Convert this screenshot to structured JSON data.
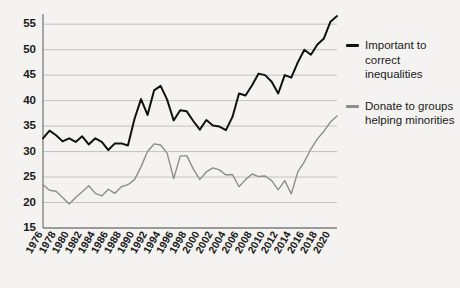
{
  "chart_data": {
    "type": "line",
    "title": "",
    "xlabel": "",
    "ylabel": "",
    "ylim": [
      15,
      57
    ],
    "yticks": [
      15,
      20,
      25,
      30,
      35,
      40,
      45,
      50,
      55
    ],
    "grid": true,
    "legend_position": "right",
    "xlim": [
      1976,
      2021
    ],
    "xtick_labels": [
      "1976",
      "1978",
      "1980",
      "1982",
      "1984",
      "1986",
      "1988",
      "1990",
      "1992",
      "1994",
      "1996",
      "1998",
      "2000",
      "2002",
      "2004",
      "2006",
      "2008",
      "2010",
      "2012",
      "2014",
      "2016",
      "2018",
      "2020"
    ],
    "x": [
      1976,
      1977,
      1978,
      1979,
      1980,
      1981,
      1982,
      1983,
      1984,
      1985,
      1986,
      1987,
      1988,
      1989,
      1990,
      1991,
      1992,
      1993,
      1994,
      1995,
      1996,
      1997,
      1998,
      1999,
      2000,
      2001,
      2002,
      2003,
      2004,
      2005,
      2006,
      2007,
      2008,
      2009,
      2010,
      2011,
      2012,
      2013,
      2014,
      2015,
      2016,
      2017,
      2018,
      2019,
      2020,
      2021
    ],
    "series": [
      {
        "name": "Important to correct inequalities",
        "color": "#111111",
        "values": [
          32.6,
          34.1,
          33.2,
          32.0,
          32.6,
          31.9,
          33.0,
          31.4,
          32.6,
          31.9,
          30.3,
          31.6,
          31.6,
          31.2,
          36.4,
          40.3,
          37.2,
          42.0,
          42.9,
          40.2,
          36.1,
          38.1,
          37.9,
          36.0,
          34.3,
          36.2,
          35.1,
          34.9,
          34.2,
          36.8,
          41.4,
          41.0,
          43.0,
          45.3,
          45.0,
          43.7,
          41.4,
          45.0,
          44.5,
          47.5,
          50.0,
          49.0,
          51.0,
          52.2,
          55.5,
          56.6
        ]
      },
      {
        "name": "Donate to groups helping minorities",
        "color": "#8d8d8a",
        "values": [
          23.5,
          22.4,
          22.2,
          21.0,
          19.7,
          21.0,
          22.1,
          23.3,
          21.8,
          21.3,
          22.6,
          21.8,
          23.1,
          23.5,
          24.5,
          27.0,
          30.0,
          31.5,
          31.3,
          29.7,
          24.7,
          29.1,
          29.2,
          26.6,
          24.5,
          26.0,
          26.8,
          26.4,
          25.4,
          25.5,
          23.1,
          24.5,
          25.6,
          25.1,
          25.2,
          24.3,
          22.5,
          24.3,
          21.7,
          26.0,
          28.0,
          30.5,
          32.5,
          34.0,
          35.8,
          37.0
        ]
      }
    ]
  },
  "legend": {
    "entries": [
      {
        "label": "Important to correct inequalities",
        "color": "#111111"
      },
      {
        "label": "Donate to groups helping minorities",
        "color": "#8d8d8a"
      }
    ]
  }
}
